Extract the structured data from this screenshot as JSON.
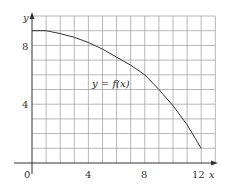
{
  "chart_data": {
    "type": "line",
    "title": "",
    "xlabel": "x",
    "ylabel": "y",
    "xlim": [
      0,
      13
    ],
    "ylim": [
      0,
      10
    ],
    "grid": true,
    "x_ticks": [
      0,
      4,
      8,
      12
    ],
    "y_ticks": [
      4,
      8
    ],
    "origin_label": "0",
    "series": [
      {
        "name": "y = f(x)",
        "x": [
          0,
          1,
          2,
          3,
          4,
          5,
          6,
          7,
          8,
          9,
          10,
          11,
          12
        ],
        "y": [
          9,
          9,
          8.8,
          8.55,
          8.2,
          7.75,
          7.2,
          6.65,
          6,
          5,
          3.9,
          2.6,
          1
        ]
      }
    ],
    "annotations": [
      {
        "text": "y = f(x)",
        "x": 5,
        "y": 5.8
      }
    ]
  },
  "labels": {
    "x_axis": "x",
    "y_axis": "y",
    "origin": "0",
    "curve": "y = f(x)",
    "x_tick_4": "4",
    "x_tick_8": "8",
    "x_tick_12": "12",
    "y_tick_4": "4",
    "y_tick_8": "8"
  }
}
